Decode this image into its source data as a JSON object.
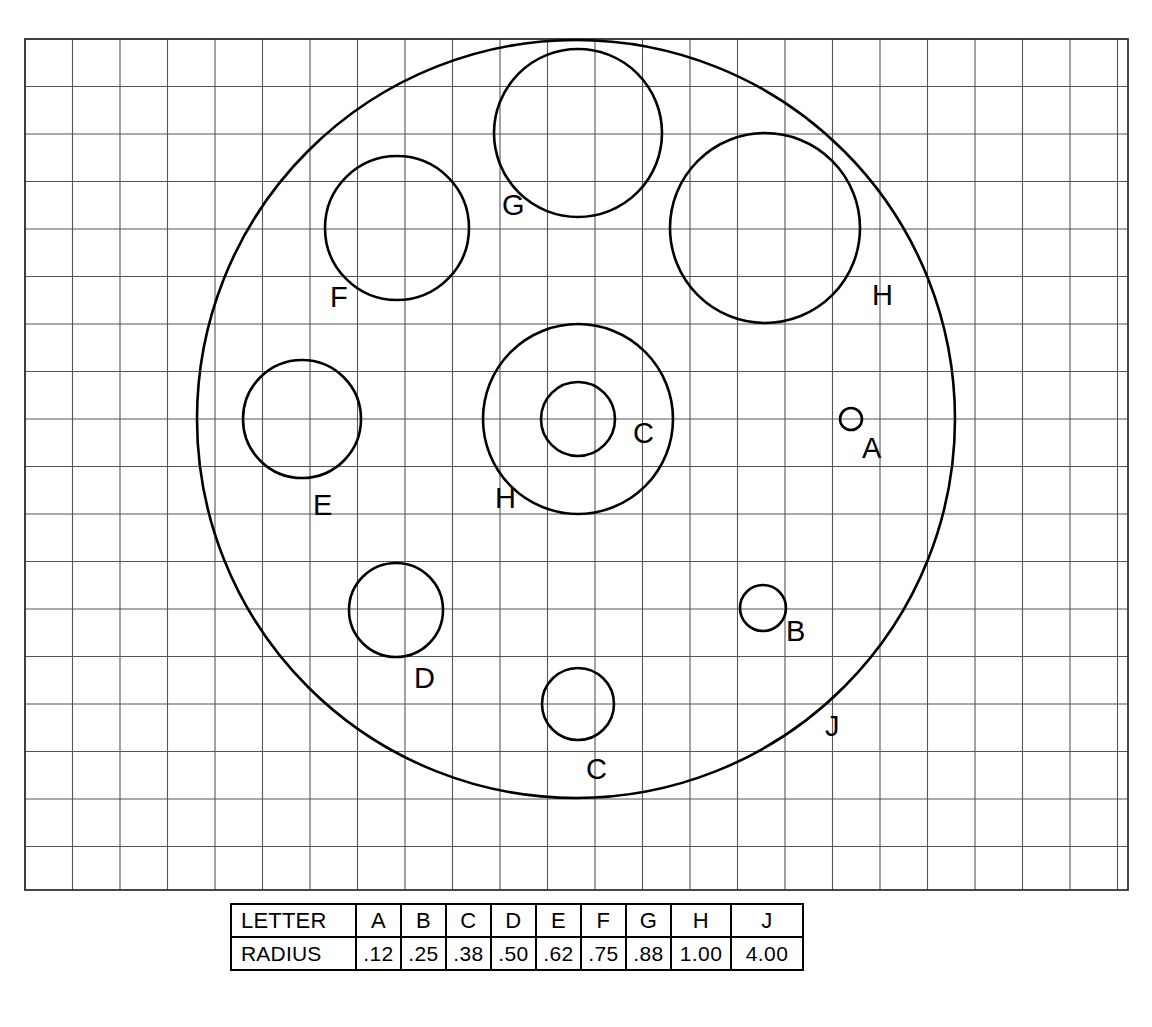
{
  "diagram": {
    "grid": {
      "x0": 25,
      "y0": 39,
      "x1": 1128,
      "y1": 890,
      "cell": 47.5,
      "line_color": "#555555",
      "border_color": "#333333"
    },
    "stroke_color": "#000000",
    "scale_px_per_unit": 95,
    "circles": [
      {
        "id": "J",
        "label": "J",
        "cx": 576,
        "cy": 419,
        "r": 379,
        "radius_units": 4.0,
        "stroke": 2.6,
        "label_x": 825,
        "label_y": 736
      },
      {
        "id": "H1",
        "label": "H",
        "cx": 765,
        "cy": 228,
        "r": 95,
        "radius_units": 1.0,
        "stroke": 2.6,
        "label_x": 872,
        "label_y": 305
      },
      {
        "id": "H2",
        "label": "H",
        "cx": 578,
        "cy": 419,
        "r": 95,
        "radius_units": 1.0,
        "stroke": 2.6,
        "label_x": 495,
        "label_y": 508
      },
      {
        "id": "G",
        "label": "G",
        "cx": 578,
        "cy": 133,
        "r": 84,
        "radius_units": 0.88,
        "stroke": 2.6,
        "label_x": 502,
        "label_y": 215
      },
      {
        "id": "F",
        "label": "F",
        "cx": 397,
        "cy": 228,
        "r": 72,
        "radius_units": 0.75,
        "stroke": 2.6,
        "label_x": 330,
        "label_y": 307
      },
      {
        "id": "E",
        "label": "E",
        "cx": 302,
        "cy": 419,
        "r": 59,
        "radius_units": 0.62,
        "stroke": 2.6,
        "label_x": 313,
        "label_y": 515
      },
      {
        "id": "D",
        "label": "D",
        "cx": 396,
        "cy": 610,
        "r": 47,
        "radius_units": 0.5,
        "stroke": 2.6,
        "label_x": 414,
        "label_y": 688
      },
      {
        "id": "C1",
        "label": "C",
        "cx": 578,
        "cy": 419,
        "r": 37,
        "radius_units": 0.38,
        "stroke": 2.6,
        "label_x": 633,
        "label_y": 443
      },
      {
        "id": "C2",
        "label": "C",
        "cx": 578,
        "cy": 704,
        "r": 36,
        "radius_units": 0.38,
        "stroke": 2.6,
        "label_x": 586,
        "label_y": 779
      },
      {
        "id": "B",
        "label": "B",
        "cx": 763,
        "cy": 608,
        "r": 23,
        "radius_units": 0.25,
        "stroke": 2.6,
        "label_x": 786,
        "label_y": 641
      },
      {
        "id": "A",
        "label": "A",
        "cx": 851,
        "cy": 419,
        "r": 11,
        "radius_units": 0.12,
        "stroke": 2.6,
        "label_x": 862,
        "label_y": 458
      }
    ]
  },
  "legend_table": {
    "rows": [
      {
        "header": "LETTER",
        "cells": [
          "A",
          "B",
          "C",
          "D",
          "E",
          "F",
          "G",
          "H",
          "J"
        ]
      },
      {
        "header": "RADIUS",
        "cells": [
          ".12",
          ".25",
          ".38",
          ".50",
          ".62",
          ".75",
          ".88",
          "1.00",
          "4.00"
        ]
      }
    ]
  },
  "chart_data": {
    "type": "table",
    "categories": [
      "A",
      "B",
      "C",
      "D",
      "E",
      "F",
      "G",
      "H",
      "J"
    ],
    "values": [
      0.12,
      0.25,
      0.38,
      0.5,
      0.62,
      0.75,
      0.88,
      1.0,
      4.0
    ],
    "xlabel": "LETTER",
    "ylabel": "RADIUS",
    "annotations": [
      "Circles drawn on a square grid; one grid square = 0.5 radius unit.",
      "J is the large enclosing circle (radius 4.00).",
      "Letters C and H each appear twice in the drawing.",
      "Circles C and H are concentric at the center of J."
    ]
  }
}
